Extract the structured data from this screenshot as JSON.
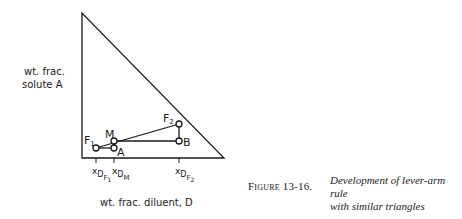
{
  "figure": {
    "label": "Figure 13-16.",
    "caption_line1": "Development of lever-arm rule",
    "caption_line2": "with similar triangles"
  },
  "axes": {
    "y_label_line1": "wt. frac.",
    "y_label_line2": "solute A",
    "x_label": "wt. frac. diluent, D"
  },
  "points": {
    "F1": {
      "main": "F",
      "sub": "1"
    },
    "M": {
      "main": "M"
    },
    "A": {
      "main": "A"
    },
    "B": {
      "main": "B"
    },
    "F2": {
      "main": "F",
      "sub": "2"
    }
  },
  "ticks": {
    "xDF1": {
      "x": "x",
      "D": "D",
      "F": "F",
      "n": "1"
    },
    "xDM": {
      "x": "x",
      "D": "D",
      "M": "M"
    },
    "xDF2": {
      "x": "x",
      "D": "D",
      "F": "F",
      "n": "2"
    }
  },
  "colors": {
    "line": "#1a1a1a",
    "background": "#ffffff"
  }
}
